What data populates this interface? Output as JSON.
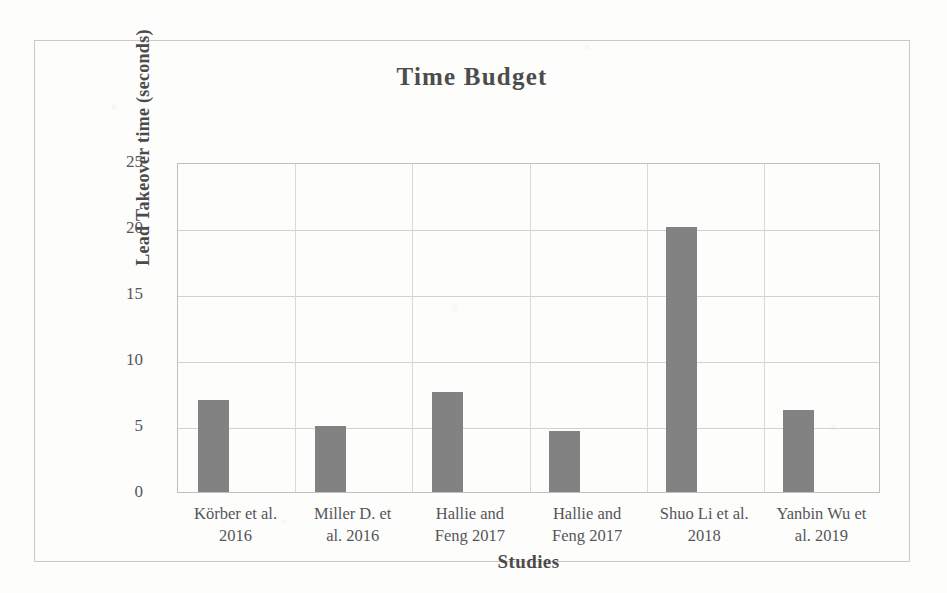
{
  "chart_data": {
    "type": "bar",
    "title": "Time Budget",
    "xlabel": "Studies",
    "ylabel": "Lead Takeover time (seconds)",
    "categories": [
      "Körber et al. 2016",
      "Miller D. et al. 2016",
      "Hallie and Feng 2017",
      "Hallie and Feng 2017",
      "Shuo Li et al. 2018",
      "Yanbin Wu et al. 2019"
    ],
    "category_lines": [
      [
        "Körber et al.",
        "2016"
      ],
      [
        "Miller D. et",
        "al. 2016"
      ],
      [
        "Hallie and",
        "Feng 2017"
      ],
      [
        "Hallie and",
        "Feng 2017"
      ],
      [
        "Shuo Li et al.",
        "2018"
      ],
      [
        "Yanbin Wu et",
        "al. 2019"
      ]
    ],
    "values": [
      7.0,
      5.0,
      7.6,
      4.6,
      20.1,
      6.2
    ],
    "ylim": [
      0,
      25
    ],
    "ytick_labels": [
      "25",
      "20",
      "15",
      "10",
      "5",
      "0"
    ],
    "ytick_values": [
      25,
      20,
      15,
      10,
      5,
      0
    ],
    "grid": true,
    "legend": false,
    "bar_color": "#828282",
    "grid_color": "#d2d2ce",
    "axis_color": "#bfbfbb",
    "text_color": "#55555a"
  }
}
